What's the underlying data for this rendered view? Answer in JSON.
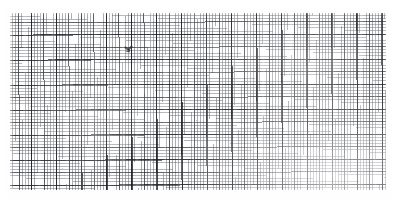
{
  "document": {
    "kind": "scanned-graph-paper",
    "title": "Graph paper scan",
    "background_color": "#ffffff",
    "paper_color": "#fefefe",
    "width_px": 399,
    "height_px": 206
  },
  "grid": {
    "label": "engineering graph paper ruling",
    "region": {
      "left_px": 10,
      "top_px": 13,
      "width_px": 376,
      "height_px": 177
    },
    "levels": [
      {
        "name": "fine",
        "spacing_px": 3.13,
        "line_width_px": 0.8,
        "color": "#5a5c62",
        "opacity": 0.5
      },
      {
        "name": "medium",
        "spacing_px": 12.52,
        "line_width_px": 1.0,
        "color": "#37393f",
        "opacity": 0.72
      },
      {
        "name": "heavy",
        "spacing_px": 25.05,
        "line_width_px": 1.15,
        "color": "#1e1f24",
        "opacity": 0.8
      }
    ],
    "fine_cells_per_major": 4,
    "fine_cells_per_heavy": 8,
    "skew_degrees": -0.16,
    "approx_columns": 120,
    "approx_rows": 57
  },
  "annotations": {
    "pencil_marks": [
      {
        "name": "scribble-mark",
        "x_px": 124,
        "y_px": 45,
        "width_px": 10,
        "height_px": 10
      }
    ],
    "specks": [
      {
        "x_px": 62,
        "y_px": 168,
        "size_px": 1.4
      },
      {
        "x_px": 248,
        "y_px": 37,
        "size_px": 1.2
      },
      {
        "x_px": 196,
        "y_px": 120,
        "size_px": 1.1
      },
      {
        "x_px": 341,
        "y_px": 96,
        "size_px": 1.3
      }
    ]
  },
  "artifacts": {
    "edge_fade": "soft white falloff at all four sheet borders",
    "exposure": "bottom-right corner washed out, center-left densest",
    "banding": "faint vertical scanner banding"
  }
}
